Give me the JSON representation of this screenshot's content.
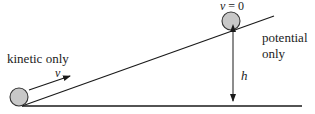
{
  "diagram": {
    "title": "",
    "labels": {
      "kinetic": "kinetic only",
      "velocity": "v",
      "velocity_zero_var": "v",
      "velocity_zero_rest": " = 0",
      "potential_line1": "potential",
      "potential_line2": "only",
      "height": "h"
    },
    "elements": {
      "ground_line": {
        "x1": 22,
        "y1": 106,
        "x2": 302,
        "y2": 106
      },
      "incline_line": {
        "x1": 22,
        "y1": 106,
        "x2": 274,
        "y2": 16
      },
      "ball_bottom": {
        "cx": 19,
        "cy": 97,
        "r": 9
      },
      "ball_top": {
        "cx": 231,
        "cy": 21,
        "r": 9
      },
      "velocity_arrow": {
        "x1": 29,
        "y1": 90,
        "x2": 70,
        "y2": 76
      },
      "height_arrow": {
        "x": 233,
        "y1": 30,
        "y2": 102
      }
    },
    "colors": {
      "line": "#1a1a1a",
      "ball_fill": "#c8c8c8",
      "ball_stroke": "#333333"
    }
  }
}
